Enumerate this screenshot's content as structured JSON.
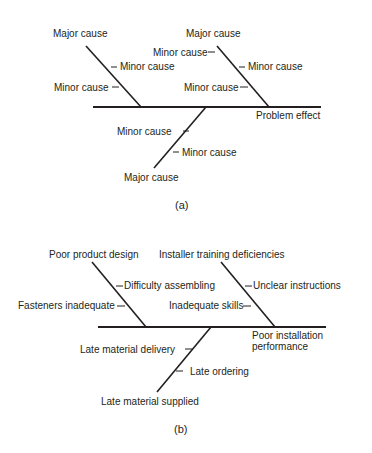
{
  "diagram_a": {
    "caption": "(a)",
    "effect": "Problem effect",
    "branches": [
      {
        "major": "Major cause",
        "minors": [
          "Minor cause",
          "Minor cause"
        ]
      },
      {
        "major": "Major cause",
        "minors": [
          "Minor cause",
          "Minor cause",
          "Minor cause"
        ]
      },
      {
        "major": "Major cause",
        "minors": [
          "Minor cause",
          "Minor cause"
        ]
      }
    ]
  },
  "diagram_b": {
    "caption": "(b)",
    "effect_line1": "Poor installation",
    "effect_line2": "performance",
    "branches": [
      {
        "major": "Poor product design",
        "minors": [
          "Difficulty assembling",
          "Fasteners inadequate"
        ]
      },
      {
        "major": "Installer training deficiencies",
        "minors": [
          "Unclear instructions",
          "Inadequate skills"
        ]
      },
      {
        "major": "Late material supplied",
        "minors": [
          "Late material delivery",
          "Late ordering"
        ]
      }
    ]
  },
  "colors": {
    "ink": "#231f20",
    "background": "#ffffff"
  }
}
